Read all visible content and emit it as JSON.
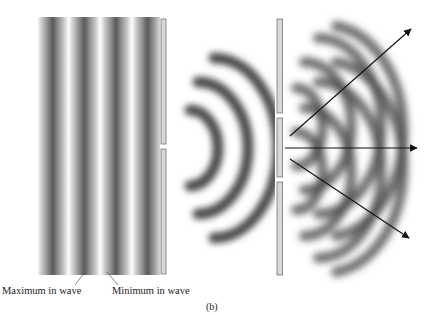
{
  "figure": {
    "panel_label": "(b)",
    "labels": {
      "maximum": "Maximum in wave",
      "minimum": "Minimum in wave"
    },
    "colors": {
      "wave_dark": "#555555",
      "wave_light": "#ffffff",
      "barrier_fill": "#d8d8d8",
      "barrier_stroke": "#777777",
      "arrow": "#111111"
    },
    "barriers": [
      {
        "name": "single-slit",
        "x": 161,
        "segments": [
          [
            19,
            144
          ],
          [
            149,
            274
          ]
        ]
      },
      {
        "name": "double-slit",
        "x": 277,
        "segments": [
          [
            19,
            113
          ],
          [
            118,
            177
          ],
          [
            182,
            275
          ]
        ]
      }
    ],
    "arrows": [
      {
        "name": "upper-diffraction-arrow",
        "from": [
          290,
          136
        ],
        "to": [
          412,
          28
        ]
      },
      {
        "name": "central-diffraction-arrow",
        "from": [
          285,
          148
        ],
        "to": [
          418,
          148
        ]
      },
      {
        "name": "lower-diffraction-arrow",
        "from": [
          290,
          159
        ],
        "to": [
          410,
          238
        ]
      }
    ]
  }
}
